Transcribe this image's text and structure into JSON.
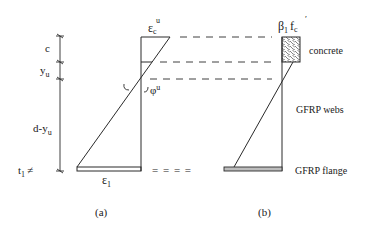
{
  "figure": {
    "panel_a": {
      "caption": "(a)",
      "strain_top_label": "ε",
      "strain_top_sub": "c",
      "strain_top_sup": "u",
      "strain_bottom_label": "ε",
      "strain_bottom_sub": "1",
      "curvature_label": "φ",
      "curvature_sup": "u"
    },
    "dimensions": {
      "c": "c",
      "yu_main": "y",
      "yu_sub": "u",
      "d_minus_yu_main": "d-y",
      "d_minus_yu_sub": "u",
      "t1_main": "t",
      "t1_sub": "1",
      "t1_mark": "≠"
    },
    "panel_b": {
      "caption": "(b)",
      "stress_label_beta": "β",
      "stress_label_beta_sub": "1",
      "stress_label_f": "f",
      "stress_label_f_sup": "′",
      "stress_label_f_sub": "c",
      "concrete_label": "concrete",
      "webs_label": "GFRP webs",
      "flange_label": "GFRP flange"
    },
    "connector_equals": "= = = ="
  },
  "colors": {
    "line": "#2a2a2a",
    "flange_fill": "#bdbdbd",
    "background": "#ffffff"
  }
}
